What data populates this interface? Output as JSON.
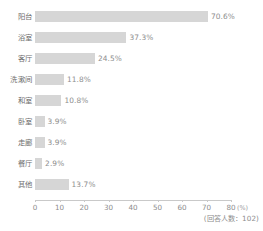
{
  "chart_data": {
    "type": "bar",
    "orientation": "horizontal",
    "title": "",
    "subtitle": "",
    "xlabel": "(%)",
    "ylabel": "",
    "xlim": [
      0,
      80
    ],
    "grid": false,
    "legend": null,
    "categories": [
      "阳台",
      "浴室",
      "客厅",
      "洗漱间",
      "和室",
      "卧室",
      "走廊",
      "餐厅",
      "其他"
    ],
    "values": [
      70.6,
      37.3,
      24.5,
      11.8,
      10.8,
      3.9,
      3.9,
      2.9,
      13.7
    ],
    "value_labels": [
      "70.6%",
      "37.3%",
      "24.5%",
      "11.8%",
      "10.8%",
      "3.9%",
      "3.9%",
      "2.9%",
      "13.7%"
    ],
    "tick_values": [
      0,
      10,
      20,
      30,
      40,
      50,
      60,
      70,
      80
    ],
    "tick_labels": [
      "0",
      "10",
      "20",
      "30",
      "40",
      "50",
      "60",
      "70",
      "80"
    ],
    "axis_unit": "(%)",
    "annotation": "(回答人数：102)",
    "bar_color": "#d6d6d6",
    "axis_color": "#c9c9c9",
    "text_color": "#8d8d8d"
  }
}
